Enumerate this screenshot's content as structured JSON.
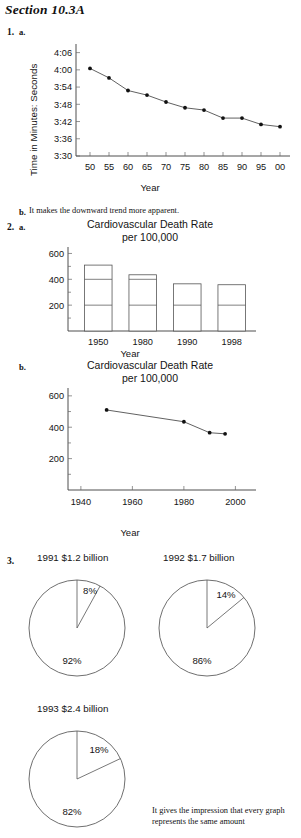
{
  "document": {
    "section_title": "Section 10.3A"
  },
  "items": [
    {
      "number": "1.",
      "part_a": "a.",
      "part_b": "b.",
      "answer_b": "It makes the downward trend more apparent."
    },
    {
      "number": "2.",
      "part_a": "a.",
      "part_b": "b."
    },
    {
      "number": "3.",
      "answer": "It gives the impression that every graph represents the same amount"
    }
  ],
  "chart_data": [
    {
      "id": "mile-record",
      "type": "line",
      "title": "",
      "xlabel": "Year",
      "ylabel": "Time in Minutes: Seconds",
      "categories": [
        "50",
        "55",
        "60",
        "65",
        "70",
        "75",
        "80",
        "85",
        "90",
        "95",
        "00"
      ],
      "ytick_labels": [
        "4:06",
        "4:00",
        "3:54",
        "3:48",
        "3:42",
        "3:36",
        "3:30"
      ],
      "ytick_values": [
        246,
        240,
        234,
        228,
        222,
        216,
        210
      ],
      "ylim": [
        210,
        249
      ],
      "values": [
        240.5,
        237.2,
        232.8,
        231.2,
        228.8,
        226.8,
        226.0,
        223.2,
        223.2,
        221.0,
        220.2
      ],
      "value_labels": [
        "4:00.5",
        "3:57.2",
        "3:52.8",
        "3:51.2",
        "3:48.8",
        "3:46.8",
        "3:46.0",
        "3:43.2",
        "3:43.2",
        "3:41.0",
        "3:40.2"
      ],
      "grid": false,
      "legend": "none"
    },
    {
      "id": "cardio-bar",
      "type": "bar",
      "title": "Cardiovascular Death Rate",
      "subtitle": "per 100,000",
      "xlabel": "Year",
      "ylabel": "",
      "categories": [
        "1950",
        "1980",
        "1990",
        "1998"
      ],
      "values": [
        510,
        435,
        365,
        358
      ],
      "ytick_labels": [
        "600",
        "400",
        "200"
      ],
      "ytick_values": [
        600,
        400,
        200
      ],
      "ylim": [
        0,
        650
      ],
      "grid": true,
      "legend": "none"
    },
    {
      "id": "cardio-line",
      "type": "line",
      "title": "Cardiovascular Death Rate",
      "subtitle": "per 100,000",
      "xlabel": "Year",
      "ylabel": "",
      "x": [
        1950,
        1980,
        1990,
        1996
      ],
      "values": [
        510,
        435,
        365,
        358
      ],
      "xtick_labels": [
        "1940",
        "1960",
        "1980",
        "2000"
      ],
      "xtick_values": [
        1940,
        1960,
        1980,
        2000
      ],
      "ytick_labels": [
        "600",
        "400",
        "200"
      ],
      "ytick_values": [
        600,
        400,
        200
      ],
      "xlim": [
        1935,
        2008
      ],
      "ylim": [
        0,
        650
      ],
      "grid": false,
      "legend": "none"
    },
    {
      "id": "pie-1991",
      "type": "pie",
      "title": "1991 $1.2 billion",
      "categories": [
        "slice-small",
        "slice-large"
      ],
      "values": [
        8,
        92
      ],
      "labels": [
        "8%",
        "92%"
      ]
    },
    {
      "id": "pie-1992",
      "type": "pie",
      "title": "1992 $1.7 billion",
      "categories": [
        "slice-small",
        "slice-large"
      ],
      "values": [
        14,
        86
      ],
      "labels": [
        "14%",
        "86%"
      ]
    },
    {
      "id": "pie-1993",
      "type": "pie",
      "title": "1993 $2.4 billion",
      "categories": [
        "slice-small",
        "slice-large"
      ],
      "values": [
        18,
        82
      ],
      "labels": [
        "18%",
        "82%"
      ]
    }
  ]
}
